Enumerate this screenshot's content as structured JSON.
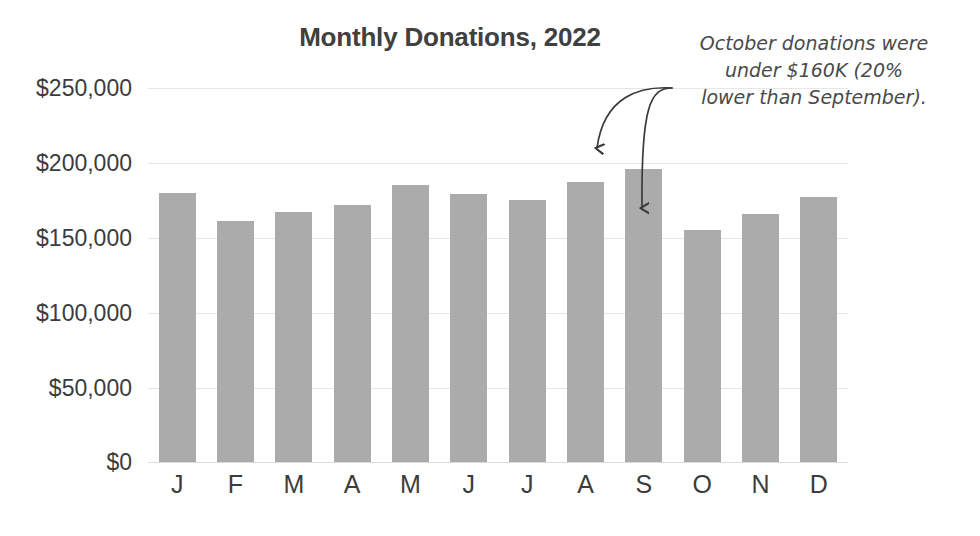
{
  "chart_data": {
    "type": "bar",
    "title": "Monthly Donations, 2022",
    "xlabel": "",
    "ylabel": "",
    "categories": [
      "J",
      "F",
      "M",
      "A",
      "M",
      "J",
      "J",
      "A",
      "S",
      "O",
      "N",
      "D"
    ],
    "category_full_names": [
      "January",
      "February",
      "March",
      "April",
      "May",
      "June",
      "July",
      "August",
      "September",
      "October",
      "November",
      "December"
    ],
    "values": [
      180000,
      161000,
      167000,
      172000,
      185000,
      179000,
      175000,
      187000,
      196000,
      155000,
      166000,
      177000
    ],
    "ylim": [
      0,
      250000
    ],
    "y_ticks": [
      0,
      50000,
      100000,
      150000,
      200000,
      250000
    ],
    "y_tick_labels": [
      "$0",
      "$50,000",
      "$100,000",
      "$150,000",
      "$200,000",
      "$250,000"
    ],
    "grid": true,
    "legend": false,
    "bar_color": "#ababab",
    "title_color": "#404040",
    "axis_text_color": "#3c3c3c",
    "gridline_color": "#e6e6e6",
    "annotations": [
      {
        "name": "october-callout",
        "lines": [
          "October donations were",
          "under $160K (20%",
          "lower than September)."
        ],
        "text": "October donations were under $160K (20% lower than September).",
        "color": "#4a4a4a",
        "points_to": [
          "S",
          "O"
        ]
      }
    ]
  },
  "arrows": {
    "september_arrow_label": "arrow-to-september-bar",
    "october_arrow_label": "arrow-to-october-bar",
    "color": "#3a3a3a"
  }
}
